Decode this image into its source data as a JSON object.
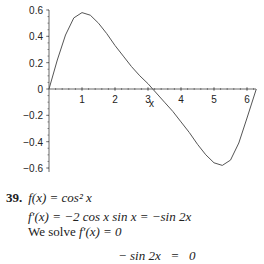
{
  "chart_data": {
    "type": "line",
    "title": "",
    "xlabel": "x",
    "ylabel": "",
    "xlim": [
      0,
      6.2832
    ],
    "ylim": [
      -0.6,
      0.6
    ],
    "grid": false,
    "x_ticks": [
      "1",
      "2",
      "3",
      "4",
      "5",
      "6"
    ],
    "y_ticks": [
      "0.6",
      "0.4",
      "0.2",
      "0",
      "-0.2",
      "-0.4",
      "-0.6"
    ],
    "series": [
      {
        "name": "curve",
        "color": "#555555",
        "x": [
          0,
          0.25,
          0.5,
          0.75,
          1.0,
          1.25,
          1.5,
          1.75,
          2.0,
          2.25,
          2.5,
          2.75,
          3.0,
          3.1416,
          3.25,
          3.5,
          3.75,
          4.0,
          4.25,
          4.5,
          4.75,
          5.0,
          5.25,
          5.5,
          5.75,
          6.0,
          6.2832
        ],
        "y": [
          0,
          0.22,
          0.41,
          0.54,
          0.58,
          0.56,
          0.5,
          0.42,
          0.33,
          0.25,
          0.17,
          0.1,
          0.04,
          0,
          -0.03,
          -0.1,
          -0.17,
          -0.25,
          -0.33,
          -0.42,
          -0.5,
          -0.56,
          -0.58,
          -0.54,
          -0.41,
          -0.22,
          0
        ]
      }
    ]
  },
  "problem": {
    "number": "39.",
    "line1": "f(x) = cos² x",
    "line2": "f′(x) = −2 cos x sin x = −sin 2x",
    "line3_prefix": "We solve ",
    "line3_math": "f′(x) = 0",
    "line4": "− sin 2x   =   0"
  }
}
